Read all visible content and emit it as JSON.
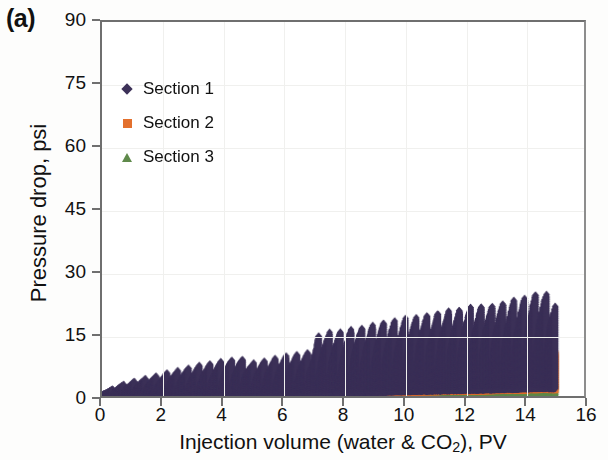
{
  "panel": {
    "label": "(a)"
  },
  "chart_data": {
    "type": "scatter",
    "title": "",
    "xlabel": "Injection volume (water & CO2), PV",
    "xlabel_parts": {
      "before": "Injection volume (water & CO",
      "sub": "2",
      "after": "), PV"
    },
    "ylabel": "Pressure drop, psi",
    "xlim": [
      0,
      16
    ],
    "ylim": [
      0,
      90
    ],
    "xticks": [
      0,
      2,
      4,
      6,
      8,
      10,
      12,
      14,
      16
    ],
    "yticks": [
      0,
      15,
      30,
      45,
      60,
      75,
      90
    ],
    "grid": true,
    "legend_position": "upper-left-inside",
    "marker_size": 3.2,
    "x_data_start": 0.0,
    "x_data_end": 15.05,
    "series": [
      {
        "name": "Section 1",
        "color": "#3c3158",
        "marker": "diamond",
        "description": "Dark navy diamonds: densely sampled oscillating pressure drop, sawtooth cycles rising from ~0 psi at 0 PV to peaks of ~23-25 psi near 14-15 PV; baseline of each cycle tracks the orange band.",
        "envelope_x": [
          0.0,
          0.6,
          1.2,
          2.0,
          3.0,
          4.0,
          4.6,
          5.0,
          6.0,
          7.0,
          7.2,
          8.0,
          9.0,
          10.0,
          11.0,
          12.0,
          13.0,
          14.0,
          14.6,
          15.0
        ],
        "envelope_top": [
          0.4,
          2.4,
          3.6,
          5.0,
          6.8,
          8.2,
          8.8,
          7.6,
          9.2,
          10.4,
          14.6,
          15.2,
          16.8,
          18.0,
          19.4,
          20.6,
          21.4,
          23.2,
          24.6,
          23.0
        ],
        "envelope_bot": [
          0.2,
          0.6,
          0.8,
          1.0,
          1.2,
          1.5,
          1.7,
          1.6,
          2.0,
          2.4,
          3.0,
          3.6,
          4.2,
          5.0,
          5.6,
          6.2,
          6.8,
          7.6,
          8.2,
          7.8
        ],
        "cycle_period_pv": 0.36
      },
      {
        "name": "Section 2",
        "color": "#e3702d",
        "marker": "square",
        "description": "Orange squares: lower band, near 0 psi until about 4.5 PV then growing steadily; sawtooth peaks reach ~6 psi at 8 PV and ~11 psi near 14.5 PV.",
        "envelope_x": [
          0.0,
          1.0,
          2.0,
          3.0,
          4.0,
          4.6,
          5.0,
          6.0,
          7.0,
          7.2,
          8.0,
          9.0,
          10.0,
          11.0,
          12.0,
          13.0,
          14.0,
          14.6,
          15.0
        ],
        "envelope_top": [
          0.2,
          0.4,
          0.6,
          0.8,
          1.0,
          1.3,
          2.6,
          3.0,
          3.4,
          4.6,
          5.6,
          6.6,
          7.4,
          8.2,
          8.8,
          9.4,
          10.4,
          11.2,
          10.6
        ],
        "envelope_bot": [
          0.1,
          0.2,
          0.3,
          0.4,
          0.5,
          0.6,
          1.2,
          1.5,
          1.8,
          2.2,
          2.8,
          3.4,
          4.0,
          4.6,
          5.0,
          5.6,
          6.2,
          6.8,
          6.4
        ],
        "cycle_period_pv": 0.36
      },
      {
        "name": "Section 3",
        "color": "#5f8a4b",
        "marker": "triangle",
        "description": "Green triangles: lowest band hugging the axis, rising very slowly from ~0 psi to a fine sawtooth of ~2-4 psi by 14-15 PV.",
        "envelope_x": [
          0.0,
          2.0,
          4.0,
          6.0,
          7.0,
          8.0,
          9.0,
          10.0,
          11.0,
          12.0,
          13.0,
          14.0,
          14.6,
          15.0
        ],
        "envelope_top": [
          0.3,
          0.5,
          0.7,
          0.9,
          1.1,
          1.5,
          1.9,
          2.3,
          2.7,
          3.0,
          3.3,
          3.8,
          4.2,
          3.9
        ],
        "envelope_bot": [
          0.0,
          0.0,
          0.1,
          0.1,
          0.2,
          0.2,
          0.3,
          0.4,
          0.5,
          0.6,
          0.7,
          0.8,
          0.9,
          0.8
        ],
        "cycle_period_pv": 0.18
      }
    ]
  },
  "legend": {
    "items": [
      {
        "label": "Section 1",
        "color": "#3c3158",
        "marker": "diamond"
      },
      {
        "label": "Section 2",
        "color": "#e3702d",
        "marker": "square"
      },
      {
        "label": "Section 3",
        "color": "#5f8a4b",
        "marker": "triangle"
      }
    ]
  }
}
